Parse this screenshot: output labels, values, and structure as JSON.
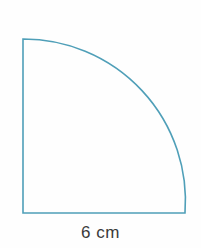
{
  "figure": {
    "name": "quarter-circle-diagram",
    "shape_type": "quarter-circle",
    "background_color": "#fefefe",
    "stroke_color": "#4f9fb8",
    "stroke_width": 1.6,
    "fill": "none",
    "geometry": {
      "center_x": 23,
      "center_y": 213,
      "radius": 162,
      "top_left_x": 23,
      "top_left_y": 39,
      "bottom_right_x": 185,
      "bottom_right_y": 213,
      "arc_path": "M 23 39 L 23 213 L 185 213 A 162 162 0 0 0 23 39 Z"
    },
    "labels": {
      "base_length": "6 cm",
      "base_length_color": "#3a3a3a"
    }
  }
}
